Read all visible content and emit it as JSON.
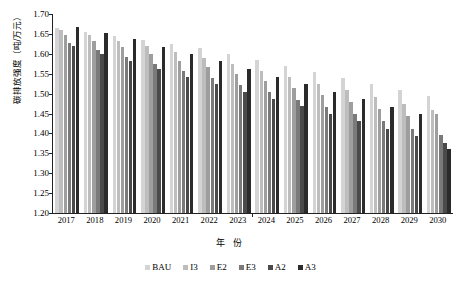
{
  "chart_data": {
    "type": "bar",
    "title": "",
    "xlabel": "年 份",
    "ylabel": "碳排放强度（吨/万元）",
    "ylim": [
      1.2,
      1.7
    ],
    "ytick_step": 0.05,
    "yticks": [
      "1.70",
      "1.65",
      "1.60",
      "1.55",
      "1.50",
      "1.45",
      "1.40",
      "1.35",
      "1.30",
      "1.25",
      "1.20"
    ],
    "grid": false,
    "legend_position": "bottom",
    "categories": [
      "2017",
      "2018",
      "2019",
      "2020",
      "2021",
      "2022",
      "2023",
      "2024",
      "2025",
      "2026",
      "2027",
      "2028",
      "2029",
      "2030"
    ],
    "series": [
      {
        "name": "BAU",
        "color": "#d4d4d4",
        "values": [
          1.665,
          1.655,
          1.645,
          1.635,
          1.625,
          1.615,
          1.6,
          1.585,
          1.57,
          1.555,
          1.54,
          1.525,
          1.51,
          1.495
        ]
      },
      {
        "name": "I3",
        "color": "#bdbdbd",
        "values": [
          1.66,
          1.648,
          1.633,
          1.62,
          1.605,
          1.59,
          1.575,
          1.558,
          1.542,
          1.525,
          1.508,
          1.492,
          1.475,
          1.458
        ]
      },
      {
        "name": "E2",
        "color": "#9e9e9e",
        "values": [
          1.648,
          1.632,
          1.617,
          1.6,
          1.583,
          1.567,
          1.55,
          1.532,
          1.515,
          1.497,
          1.48,
          1.462,
          1.445,
          1.448
        ]
      },
      {
        "name": "E3",
        "color": "#7a7a7a",
        "values": [
          1.628,
          1.61,
          1.593,
          1.575,
          1.557,
          1.54,
          1.522,
          1.503,
          1.485,
          1.467,
          1.448,
          1.43,
          1.412,
          1.395
        ]
      },
      {
        "name": "A2",
        "color": "#4a4a4a",
        "values": [
          1.62,
          1.6,
          1.582,
          1.562,
          1.543,
          1.525,
          1.505,
          1.487,
          1.468,
          1.45,
          1.43,
          1.412,
          1.393,
          1.375
        ]
      },
      {
        "name": "A3",
        "color": "#2b2b2b",
        "values": [
          1.668,
          1.652,
          1.637,
          1.618,
          1.6,
          1.582,
          1.562,
          1.543,
          1.525,
          1.505,
          1.487,
          1.467,
          1.448,
          1.362
        ]
      }
    ]
  }
}
